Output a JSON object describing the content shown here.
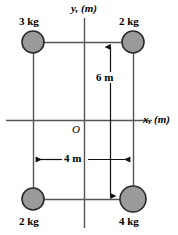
{
  "figure": {
    "title": "",
    "axes": {
      "y_label": "y, (m)",
      "x_label": "x, (m)",
      "origin_label": "O",
      "axis_color": "#555555"
    },
    "masses": [
      {
        "id": "top-left",
        "label": "3 kg",
        "x": 33,
        "y": 42,
        "r": 11
      },
      {
        "id": "top-right",
        "label": "2 kg",
        "x": 133,
        "y": 42,
        "r": 11
      },
      {
        "id": "bottom-left",
        "label": "2 kg",
        "x": 33,
        "y": 199,
        "r": 11
      },
      {
        "id": "bottom-right",
        "label": "4 kg",
        "x": 133,
        "y": 199,
        "r": 13
      }
    ],
    "dimensions": [
      {
        "id": "vertical",
        "label": "6 m",
        "orientation": "vertical",
        "value": 6,
        "unit": "m"
      },
      {
        "id": "horizontal",
        "label": "4 m",
        "orientation": "horizontal",
        "value": 4,
        "unit": "m"
      }
    ],
    "colors": {
      "mass_fill": "#9a9a9a",
      "mass_stroke": "#2b2b2b",
      "line": "#555555",
      "dim_line": "#111111",
      "text": "#000000"
    }
  }
}
